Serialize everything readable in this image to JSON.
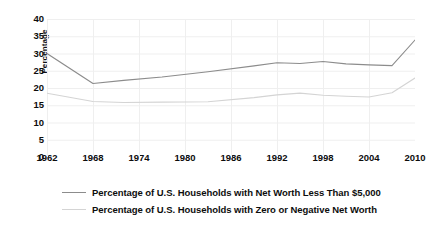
{
  "chart_data": {
    "type": "line",
    "title": "",
    "xlabel": "",
    "ylabel": "Percentage",
    "xlim": [
      1962,
      2010
    ],
    "ylim": [
      0,
      40
    ],
    "ytick_step": 5,
    "grid": true,
    "legend_position": "bottom",
    "yticks": [
      "40",
      "35",
      "30",
      "25",
      "20",
      "15",
      "10",
      "5",
      "0"
    ],
    "xticks": [
      "1962",
      "1968",
      "1974",
      "1980",
      "1986",
      "1992",
      "1998",
      "2004",
      "2010"
    ],
    "series": [
      {
        "name": "Percentage of U.S. Households with Net Worth Less Than $5,000",
        "color": "#8c8c8c",
        "x": [
          1962,
          1968,
          1972,
          1977,
          1983,
          1989,
          1992,
          1995,
          1998,
          2001,
          2004,
          2007,
          2010
        ],
        "values": [
          30.0,
          21.3,
          22.2,
          23.2,
          24.7,
          26.4,
          27.3,
          27.1,
          27.7,
          27.0,
          26.7,
          26.5,
          33.9
        ]
      },
      {
        "name": "Percentage of U.S. Households with Zero or Negative Net Worth",
        "color": "#d4d4d4",
        "x": [
          1962,
          1968,
          1972,
          1977,
          1983,
          1989,
          1992,
          1995,
          1998,
          2001,
          2004,
          2007,
          2010
        ],
        "values": [
          18.5,
          16.1,
          15.8,
          15.9,
          16.0,
          17.2,
          18.0,
          18.5,
          17.9,
          17.6,
          17.4,
          18.6,
          22.9
        ]
      }
    ]
  },
  "axis": {
    "y_title": "Percentage"
  },
  "legend": {
    "items": [
      {
        "label": "Percentage of U.S. Households with Net Worth Less Than $5,000",
        "color": "#8c8c8c"
      },
      {
        "label": "Percentage of U.S. Households with Zero or Negative Net Worth",
        "color": "#d4d4d4"
      }
    ]
  },
  "colors": {
    "background": "#ffffff",
    "grid": "#efefef",
    "text": "#0d0d0d",
    "series_1": "#8c8c8c",
    "series_2": "#d4d4d4"
  }
}
